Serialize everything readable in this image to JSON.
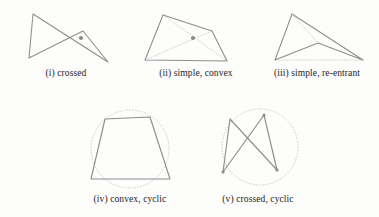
{
  "figure": {
    "background_color": "#fdfdfc",
    "stroke_color": "#1d1d1d",
    "dotted_color": "#9a9a9a",
    "caption_color": "#1c1c1c",
    "panels": [
      {
        "id": "i",
        "caption": "(i) crossed",
        "type": "crossed",
        "has_circle": false,
        "has_diagonals": false,
        "has_center_dot": true,
        "center_dot": [
          81,
          38
        ],
        "vertices": [
          [
            33,
            14
          ],
          [
            29,
            58
          ],
          [
            108,
            62
          ],
          [
            83,
            31
          ]
        ],
        "edges": [
          [
            0,
            1
          ],
          [
            1,
            3
          ],
          [
            3,
            2
          ],
          [
            2,
            0
          ]
        ]
      },
      {
        "id": "ii",
        "caption": "(ii) simple, convex",
        "type": "simple-convex",
        "has_circle": false,
        "has_diagonals": true,
        "has_center_dot": true,
        "center_dot": [
          193,
          38
        ],
        "vertices": [
          [
            163,
            15
          ],
          [
            145,
            60
          ],
          [
            227,
            61
          ],
          [
            212,
            31
          ]
        ],
        "edges": [
          [
            0,
            1
          ],
          [
            1,
            2
          ],
          [
            2,
            3
          ],
          [
            3,
            0
          ]
        ],
        "diagonals": [
          [
            0,
            2
          ],
          [
            1,
            3
          ]
        ]
      },
      {
        "id": "iii",
        "caption": "(iii) simple, re-entrant",
        "type": "simple-re-entrant",
        "has_circle": false,
        "has_diagonals": true,
        "has_center_dot": false,
        "vertices": [
          [
            292,
            14
          ],
          [
            275,
            60
          ],
          [
            318,
            43
          ],
          [
            363,
            60
          ]
        ],
        "edges": [
          [
            0,
            1
          ],
          [
            1,
            2
          ],
          [
            2,
            3
          ],
          [
            3,
            0
          ]
        ],
        "diagonals": [
          [
            0,
            2
          ],
          [
            1,
            3
          ]
        ]
      },
      {
        "id": "iv",
        "caption": "(iv) convex, cyclic",
        "type": "convex-cyclic",
        "has_circle": true,
        "has_diagonals": false,
        "has_center_dot": false,
        "circle": {
          "cx": 130,
          "cy": 149,
          "r": 39
        },
        "vertices": [
          [
            105,
            119
          ],
          [
            91,
            179
          ],
          [
            170,
            179
          ],
          [
            150,
            117
          ]
        ],
        "edges": [
          [
            0,
            1
          ],
          [
            1,
            2
          ],
          [
            2,
            3
          ],
          [
            3,
            0
          ]
        ]
      },
      {
        "id": "v",
        "caption": "(v) crossed, cyclic",
        "type": "crossed-cyclic",
        "has_circle": true,
        "has_diagonals": false,
        "has_center_dot": false,
        "circle": {
          "cx": 260,
          "cy": 147,
          "r": 38
        },
        "vertices": [
          [
            230,
            119
          ],
          [
            223,
            172
          ],
          [
            277,
            170
          ],
          [
            264,
            115
          ]
        ],
        "edges": [
          [
            0,
            1
          ],
          [
            1,
            3
          ],
          [
            3,
            2
          ],
          [
            2,
            0
          ]
        ]
      }
    ]
  }
}
